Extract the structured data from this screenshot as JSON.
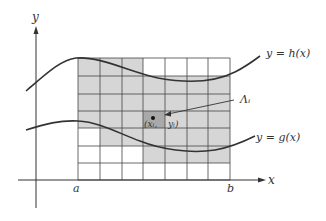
{
  "diagram": {
    "axes": {
      "x_label": "x",
      "y_label": "y",
      "a_label": "a",
      "b_label": "b"
    },
    "curves": {
      "upper_label": "y = h(x)",
      "lower_label": "y = g(x)"
    },
    "cell": {
      "label": "Λᵢ",
      "point_label_left": "(xᵢ,",
      "point_label_right": "yᵢ)"
    },
    "grid": {
      "x_lines": [
        78,
        100,
        122,
        143,
        165,
        187,
        208,
        230
      ],
      "y_lines": [
        58,
        76,
        94,
        111,
        128,
        146,
        163,
        180
      ],
      "shaded_cells": [
        [
          1,
          1,
          1,
          0,
          0,
          0,
          0
        ],
        [
          1,
          1,
          1,
          1,
          1,
          1,
          1
        ],
        [
          1,
          1,
          1,
          1,
          1,
          1,
          1
        ],
        [
          1,
          1,
          1,
          2,
          1,
          1,
          1
        ],
        [
          0,
          1,
          1,
          1,
          1,
          1,
          1
        ],
        [
          0,
          0,
          0,
          1,
          1,
          1,
          1
        ],
        [
          0,
          0,
          0,
          0,
          0,
          0,
          0
        ]
      ]
    },
    "colors": {
      "shade": "#d6d6d6",
      "dark_cell": "#a9a9a9",
      "line": "#333333",
      "grid": "#444444"
    }
  }
}
